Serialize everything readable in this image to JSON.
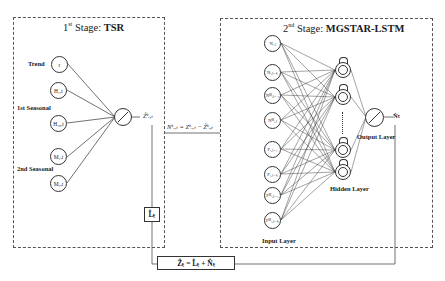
{
  "stage1": {
    "title_prefix": "1",
    "title_sup": "st",
    "title_mid": " Stage: ",
    "title_bold": "TSR",
    "labels": {
      "trend": "Trend",
      "seasonal1": "1st Seasonal",
      "seasonal2": "2nd Seasonal"
    },
    "nodes": [
      "r",
      "H₁,t",
      "H₄₈,t",
      "M₁,t",
      "M₇,t"
    ],
    "output": "Ẑᵏᵢ,ₜ",
    "l_box": "L̂ₜ"
  },
  "connector": {
    "equation": "Nᵏᵢ,ₜ = Zᵏᵢ,ₜ − Ẑᵏᵢ,ₜ"
  },
  "stage2": {
    "title_prefix": "2",
    "title_sup": "nd",
    "title_mid": " Stage: ",
    "title_bold": "MGSTAR-LSTM",
    "input_nodes": [
      "Nᵢ,ₜ",
      "Nᵢ,ₜ₋ₖ",
      "Nᴹᵢ,ₜ₋₁",
      "Nᴹᵢ,ₜ",
      "Fᵢ,ₜ₋₁",
      "Fᵢ,ₜ₋ₖ",
      "Fᴹᵢ,ₜ₋₁",
      "Fᴹᵢ,ₜ₋ₖ"
    ],
    "labels": {
      "input_layer": "Input Layer",
      "hidden_layer": "Hidden Layer",
      "output_layer": "Output Layer"
    },
    "output": "N̂ₜ"
  },
  "final": {
    "equation": "Ẑₜ  =  L̂ₜ  +  N̂ₜ"
  }
}
